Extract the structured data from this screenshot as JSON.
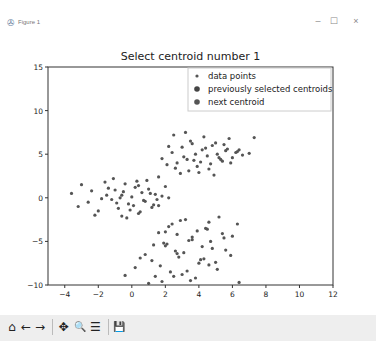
{
  "window": {
    "title": "Figure 1",
    "app_icon": "matplotlib-icon",
    "controls": {
      "minimize": "–",
      "maximize": "☐",
      "close": "×"
    }
  },
  "toolbar": {
    "items": [
      {
        "name": "home-icon",
        "glyph": "⌂",
        "label": "Home"
      },
      {
        "name": "back-icon",
        "glyph": "←",
        "label": "Back"
      },
      {
        "name": "forward-icon",
        "glyph": "→",
        "label": "Forward"
      },
      {
        "name": "pan-icon",
        "glyph": "✥",
        "label": "Pan"
      },
      {
        "name": "zoom-icon",
        "glyph": "🔍",
        "label": "Zoom"
      },
      {
        "name": "configure-subplots-icon",
        "glyph": "☰",
        "label": "Configure subplots"
      },
      {
        "name": "save-icon",
        "glyph": "💾",
        "label": "Save"
      }
    ]
  },
  "chart_data": {
    "type": "scatter",
    "title": "Select centroid number  1",
    "xlabel": "",
    "ylabel": "",
    "xlim": [
      -5,
      12
    ],
    "ylim": [
      -10,
      15
    ],
    "xticks": [
      -4,
      -2,
      0,
      2,
      4,
      6,
      8,
      10,
      12
    ],
    "yticks": [
      -10,
      -5,
      0,
      5,
      10,
      15
    ],
    "grid": false,
    "legend_position": "upper right",
    "legend": [
      "data points",
      "previously selected centroids",
      "next centroid"
    ],
    "colors": {
      "data_points": "#555555",
      "previous_centroids": "#444444",
      "next_centroid": "#555555"
    },
    "series": [
      {
        "name": "data points",
        "description": "Three clusters of approx. 100 points each, centers near (0,0), (3.5,5) and (3.5,-5.5)",
        "clusters": [
          {
            "center": [
              0,
              0
            ],
            "x_range": [
              -3.8,
              2.5
            ],
            "y_range": [
              -2.5,
              2.5
            ]
          },
          {
            "center": [
              3.5,
              5
            ],
            "x_range": [
              1.5,
              7.5
            ],
            "y_range": [
              2.5,
              7.5
            ]
          },
          {
            "center": [
              3.5,
              -5.5
            ],
            "x_range": [
              -0.5,
              6.5
            ],
            "y_range": [
              -10,
              -1
            ]
          }
        ],
        "x": [
          -3.6,
          -3.2,
          -3.0,
          -2.6,
          -2.4,
          -2.0,
          -1.6,
          -1.2,
          -1.0,
          -0.8,
          -0.6,
          -0.4,
          -0.2,
          0.0,
          0.2,
          0.4,
          0.6,
          0.8,
          1.0,
          1.2,
          1.4,
          1.6,
          1.8,
          2.0,
          -1.8,
          -1.4,
          -0.9,
          -0.5,
          -0.1,
          0.3,
          0.7,
          1.1,
          -2.2,
          -1.1,
          -0.3,
          0.5,
          1.3,
          2.2,
          -0.7,
          0.1,
          0.9,
          -1.5,
          -0.6,
          0.4,
          1.5,
          1.8,
          2.1,
          2.4,
          2.7,
          3.0,
          3.3,
          3.6,
          3.9,
          4.2,
          4.5,
          4.8,
          5.1,
          5.4,
          5.7,
          6.0,
          6.3,
          6.6,
          7.0,
          2.2,
          2.6,
          3.1,
          3.5,
          3.8,
          4.1,
          4.4,
          4.7,
          5.0,
          5.3,
          5.6,
          5.9,
          6.2,
          2.9,
          3.4,
          4.0,
          4.6,
          5.2,
          5.8,
          6.4,
          3.2,
          3.7,
          4.3,
          4.9,
          5.5,
          2.5,
          7.3,
          1.6,
          0.2,
          0.8,
          1.2,
          1.6,
          2.0,
          2.4,
          2.8,
          3.2,
          3.6,
          4.0,
          4.4,
          4.8,
          5.2,
          5.6,
          6.0,
          6.3,
          1.4,
          1.9,
          2.3,
          2.7,
          3.1,
          3.5,
          3.9,
          4.3,
          4.7,
          5.1,
          5.5,
          5.9,
          1.0,
          1.7,
          2.2,
          2.6,
          3.0,
          3.4,
          3.8,
          4.2,
          4.6,
          5.0,
          5.4,
          1.8,
          2.5,
          3.3,
          4.1,
          4.5,
          2.1,
          2.9,
          3.6,
          0.5,
          -0.4,
          6.4,
          1.3,
          2.0,
          2.7,
          4.6
        ],
        "y": [
          0.5,
          -1.0,
          1.5,
          -0.5,
          0.8,
          -1.5,
          1.8,
          -0.2,
          0.9,
          -1.2,
          0.3,
          1.6,
          -0.7,
          0.1,
          1.2,
          -1.8,
          0.6,
          -0.4,
          1.0,
          -1.1,
          0.4,
          -0.9,
          0.2,
          1.3,
          -0.1,
          1.1,
          -0.6,
          0.7,
          -1.4,
          1.9,
          -0.3,
          0.5,
          -2.0,
          2.2,
          -2.3,
          -1.6,
          -0.8,
          0.0,
          0.0,
          -0.9,
          2.0,
          0.3,
          -2.1,
          1.4,
          -0.2,
          4.5,
          3.8,
          5.2,
          4.0,
          5.8,
          4.4,
          6.2,
          3.6,
          5.5,
          4.8,
          6.0,
          5.0,
          4.2,
          5.6,
          4.6,
          5.3,
          4.9,
          5.1,
          5.9,
          3.4,
          4.7,
          6.5,
          5.0,
          4.1,
          5.7,
          3.9,
          6.3,
          4.4,
          5.4,
          4.0,
          5.2,
          2.8,
          3.1,
          2.9,
          3.3,
          4.6,
          6.8,
          5.5,
          7.5,
          4.3,
          7.0,
          2.6,
          6.1,
          7.2,
          6.9,
          2.4,
          -8.0,
          -6.5,
          -7.2,
          -4.0,
          -5.5,
          -3.0,
          -6.8,
          -2.5,
          -4.8,
          -7.5,
          -3.5,
          -5.8,
          -2.2,
          -6.0,
          -4.4,
          -3.0,
          -9.0,
          -5.2,
          -8.5,
          -4.2,
          -6.3,
          -9.5,
          -3.8,
          -7.0,
          -5.0,
          -8.2,
          -4.6,
          -6.6,
          -9.8,
          -7.8,
          -3.3,
          -6.1,
          -8.8,
          -4.9,
          -9.2,
          -5.6,
          -2.8,
          -7.4,
          -4.1,
          -9.6,
          -9.0,
          -8.4,
          -7.1,
          -3.6,
          -5.3,
          -2.6,
          -4.5,
          -6.9,
          -8.9,
          -9.7,
          -5.4,
          -3.9,
          -6.4,
          -7.7
        ]
      },
      {
        "name": "previously selected centroids",
        "x": [],
        "y": []
      },
      {
        "name": "next centroid",
        "x": [],
        "y": []
      }
    ]
  }
}
